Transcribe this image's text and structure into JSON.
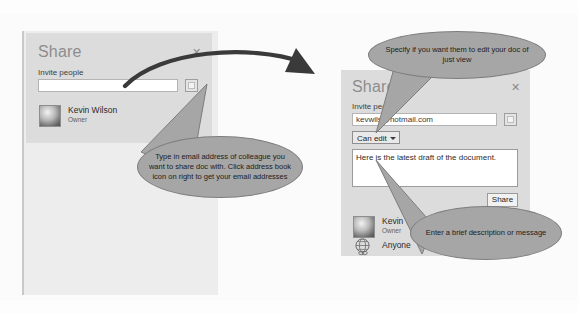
{
  "left_dialog": {
    "title": "Share",
    "close_label": "✕",
    "invite_label": "Invite people",
    "invite_value": "",
    "invite_placeholder": "",
    "address_book_icon": "address-book-icon",
    "person": {
      "name": "Kevin Wilson",
      "role": "Owner",
      "avatar_icon": "avatar-icon"
    }
  },
  "right_dialog": {
    "title": "Share",
    "close_label": "✕",
    "invite_label": "Invite people",
    "invite_value": "kevwils@hotmail.com",
    "invite_placeholder": "",
    "address_book_icon": "address-book-icon",
    "permission_value": "Can edit",
    "permission_options": [
      "Can edit",
      "Can view"
    ],
    "message_value": "Here is the latest draft of the document.",
    "message_placeholder": "",
    "share_button": "Share",
    "person": {
      "name": "Kevin Wilson",
      "role": "Owner",
      "avatar_icon": "avatar-icon"
    },
    "link_row": {
      "label": "Anyone",
      "icon": "globe-link-icon"
    }
  },
  "callouts": {
    "invite_field": "Type in email address of colleague you want to share doc with. Click address book icon on right to get your email addresses",
    "permission": "Specify if you want them to edit your doc of just view",
    "message": "Enter a brief description or message"
  },
  "colors": {
    "dialog_bg": "#dcdcdc",
    "backdrop_panel": "#ededed",
    "callout_fill": "#a6a6a6",
    "callout_stroke": "#7d7d7d",
    "arrow": "#3a3a3a",
    "title_text": "#8d8d8d"
  }
}
